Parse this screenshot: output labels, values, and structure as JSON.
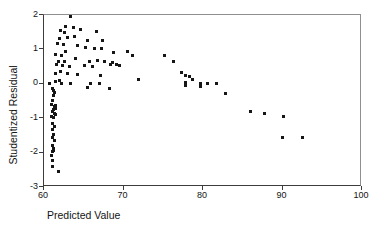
{
  "chart_data": {
    "type": "scatter",
    "title": "",
    "xlabel": "Predicted Value",
    "ylabel": "Studentized Residual",
    "xlim": [
      60,
      100
    ],
    "ylim": [
      -3,
      2
    ],
    "x_ticks": [
      "60",
      "70",
      "80",
      "90",
      "100"
    ],
    "x_tick_values": [
      60,
      70,
      80,
      90,
      100
    ],
    "y_ticks": [
      "2",
      "1",
      "0",
      "-1",
      "-2",
      "-3"
    ],
    "y_tick_values": [
      2,
      1,
      0,
      -1,
      -2,
      -3
    ],
    "grid": false,
    "legend": "none",
    "marker_color": "#161616",
    "points": [
      [
        63.5,
        1.94
      ],
      [
        62.8,
        1.65
      ],
      [
        63.8,
        1.62
      ],
      [
        64.7,
        1.56
      ],
      [
        62.2,
        1.51
      ],
      [
        62.7,
        1.45
      ],
      [
        66.7,
        1.48
      ],
      [
        62.1,
        1.3
      ],
      [
        63.1,
        1.33
      ],
      [
        64.0,
        1.36
      ],
      [
        65.6,
        1.24
      ],
      [
        67.5,
        1.22
      ],
      [
        61.8,
        1.13
      ],
      [
        62.6,
        1.1
      ],
      [
        64.3,
        1.07
      ],
      [
        65.3,
        1.04
      ],
      [
        66.5,
        1.01
      ],
      [
        67.3,
        1.01
      ],
      [
        62.8,
        0.92
      ],
      [
        61.6,
        0.81
      ],
      [
        62.3,
        0.78
      ],
      [
        64.1,
        0.72
      ],
      [
        61.9,
        0.63
      ],
      [
        62.7,
        0.63
      ],
      [
        65.8,
        0.63
      ],
      [
        66.8,
        0.66
      ],
      [
        67.7,
        0.63
      ],
      [
        68.7,
        0.58
      ],
      [
        61.7,
        0.52
      ],
      [
        62.4,
        0.49
      ],
      [
        63.3,
        0.46
      ],
      [
        65.2,
        0.49
      ],
      [
        66.2,
        0.46
      ],
      [
        69.3,
        0.52
      ],
      [
        62.2,
        0.34
      ],
      [
        61.6,
        0.28
      ],
      [
        63.1,
        0.26
      ],
      [
        64.3,
        0.23
      ],
      [
        67.2,
        0.2
      ],
      [
        62.1,
        0.08
      ],
      [
        61.6,
        0.05
      ],
      [
        66.0,
        -0.01
      ],
      [
        60.8,
        -0.01
      ],
      [
        62.3,
        -0.01
      ],
      [
        63.5,
        -0.01
      ],
      [
        67.1,
        -0.01
      ],
      [
        65.6,
        -0.15
      ],
      [
        68.4,
        -0.18
      ],
      [
        61.2,
        -0.18
      ],
      [
        61.35,
        -0.22
      ],
      [
        61.4,
        -0.27
      ],
      [
        61.3,
        -0.38
      ],
      [
        61.2,
        -0.5
      ],
      [
        61.1,
        -0.62
      ],
      [
        61.6,
        -0.65
      ],
      [
        61.4,
        -0.7
      ],
      [
        61.6,
        -0.76
      ],
      [
        61.3,
        -0.79
      ],
      [
        61.2,
        -0.82
      ],
      [
        61.4,
        -0.88
      ],
      [
        61.6,
        -0.91
      ],
      [
        61.1,
        -0.97
      ],
      [
        61.3,
        -1.02
      ],
      [
        61.2,
        -1.17
      ],
      [
        61.4,
        -1.26
      ],
      [
        61.2,
        -1.37
      ],
      [
        61.3,
        -1.49
      ],
      [
        61.2,
        -1.58
      ],
      [
        61.4,
        -1.69
      ],
      [
        61.2,
        -1.81
      ],
      [
        61.3,
        -1.9
      ],
      [
        61.3,
        -1.98
      ],
      [
        61.2,
        -2.01
      ],
      [
        61.1,
        -2.1
      ],
      [
        61.2,
        -2.27
      ],
      [
        61.2,
        -2.42
      ],
      [
        61.9,
        -2.59
      ],
      [
        68.9,
        0.87
      ],
      [
        70.6,
        0.92
      ],
      [
        71.2,
        0.78
      ],
      [
        68.5,
        0.52
      ],
      [
        69.6,
        0.49
      ],
      [
        72.0,
        0.11
      ],
      [
        75.3,
        0.78
      ],
      [
        76.4,
        0.63
      ],
      [
        77.4,
        0.31
      ],
      [
        77.9,
        0.2
      ],
      [
        78.4,
        0.17
      ],
      [
        77.9,
        0.02
      ],
      [
        77.9,
        -0.09
      ],
      [
        78.8,
        0.11
      ],
      [
        79.8,
        -0.01
      ],
      [
        79.8,
        -0.12
      ],
      [
        80.7,
        -0.01
      ],
      [
        81.8,
        -0.01
      ],
      [
        82.9,
        -0.3
      ],
      [
        86.1,
        -0.82
      ],
      [
        87.9,
        -0.88
      ],
      [
        90.2,
        -0.97
      ],
      [
        90.1,
        -1.6
      ],
      [
        92.7,
        -1.58
      ]
    ]
  }
}
